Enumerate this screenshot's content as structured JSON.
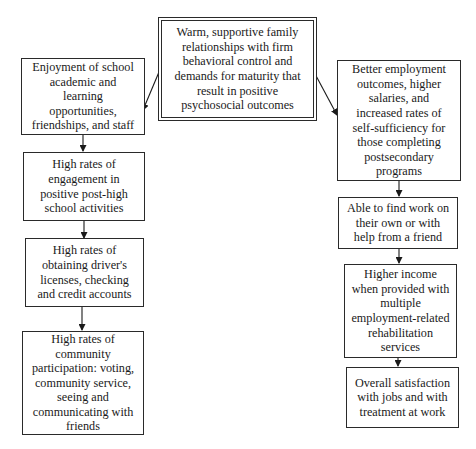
{
  "diagram": {
    "type": "flowchart",
    "center": {
      "text": "Warm, supportive family relationships with firm behavioral control and demands for maturity that result in positive psychosocial outcomes",
      "lines": [
        "Warm, supportive family",
        "relationships with firm",
        "behavioral control and",
        "demands for maturity that",
        "result in positive",
        "psychosocial outcomes"
      ]
    },
    "left_column": [
      {
        "lines": [
          "Enjoyment of school",
          "academic and",
          "learning",
          "opportunities,",
          "friendships, and staff"
        ]
      },
      {
        "lines": [
          "High rates of",
          "engagement in",
          "positive post-high",
          "school activities"
        ]
      },
      {
        "lines": [
          "High rates of",
          "obtaining driver's",
          "licenses, checking",
          "and credit accounts"
        ]
      },
      {
        "lines": [
          "High rates of",
          "community",
          "participation: voting,",
          "community service,",
          "seeing and",
          "communicating with",
          "friends"
        ]
      }
    ],
    "right_column": [
      {
        "lines": [
          "Better employment",
          "outcomes, higher",
          "salaries, and",
          "increased rates of",
          "self-sufficiency for",
          "those completing",
          "postsecondary",
          "programs"
        ]
      },
      {
        "lines": [
          "Able to find work on",
          "their own or with",
          "help from a friend"
        ]
      },
      {
        "lines": [
          "Higher income",
          "when provided with",
          "multiple",
          "employment-related",
          "rehabilitation",
          "services"
        ]
      },
      {
        "lines": [
          "Overall satisfaction",
          "with jobs and with",
          "treatment at work"
        ]
      }
    ],
    "edges": [
      {
        "from": "center",
        "to": "left_column.0"
      },
      {
        "from": "center",
        "to": "right_column.0"
      },
      {
        "from": "left_column.0",
        "to": "left_column.1"
      },
      {
        "from": "left_column.1",
        "to": "left_column.2"
      },
      {
        "from": "left_column.2",
        "to": "left_column.3"
      },
      {
        "from": "right_column.0",
        "to": "right_column.1"
      },
      {
        "from": "right_column.1",
        "to": "right_column.2"
      },
      {
        "from": "right_column.2",
        "to": "right_column.3"
      }
    ],
    "colors": {
      "stroke": "#2a2a2a",
      "background": "#ffffff",
      "text": "#1a1a1a"
    }
  }
}
